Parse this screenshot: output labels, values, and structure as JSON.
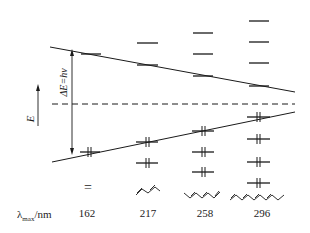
{
  "diagram": {
    "energy_axis_label": "E",
    "transition_label": "ΔE=hν",
    "row_label_main": "λ",
    "row_label_sub": "max",
    "row_label_unit": "/nm",
    "molecule_ethene_symbol": "=",
    "columns": [
      {
        "molecule": "ethene",
        "lambda_max": "162",
        "lumo_count": 1,
        "homo_count": 1
      },
      {
        "molecule": "1,3-butadiene",
        "lambda_max": "217",
        "lumo_count": 2,
        "homo_count": 2
      },
      {
        "molecule": "1,3,5-hexatriene",
        "lambda_max": "258",
        "lumo_count": 3,
        "homo_count": 3
      },
      {
        "molecule": "1,3,5,7-octatetraene",
        "lambda_max": "296",
        "lumo_count": 4,
        "homo_count": 4
      }
    ],
    "colors": {
      "line": "#1a1a1a",
      "background": "#ffffff"
    }
  }
}
